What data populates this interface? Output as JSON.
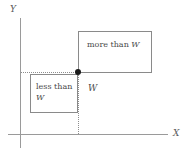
{
  "figure": {
    "background_color": "#ffffff",
    "axis_color": "#9a9a9a",
    "box_border_color": "#8a8a8a",
    "dotted_line_color": "#8d8d8d",
    "point_color": "#1a1a1a",
    "text_color": "#4a4a4a"
  },
  "axes": {
    "y_label": "Y",
    "x_label": "X"
  },
  "regions": {
    "upper_right": {
      "label": "more than W",
      "label_prefix": "more than ",
      "label_variable": "W"
    },
    "lower_left": {
      "label": "less than W",
      "label_prefix": "less than",
      "label_variable": "W"
    },
    "center": {
      "label": "W"
    }
  },
  "markers": {
    "breakpoint": "threshold-point"
  }
}
